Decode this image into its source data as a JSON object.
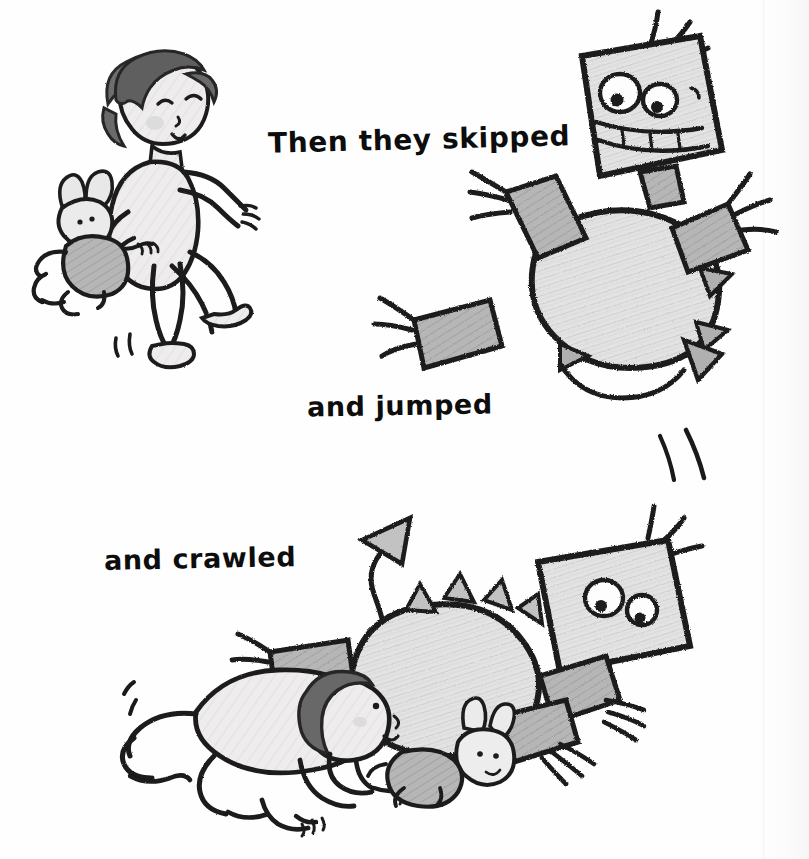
{
  "page": {
    "type": "childrens-book-illustration-page",
    "background_color": "#ffffff",
    "medium": "pencil and ink sketch",
    "width": 809,
    "height": 859
  },
  "captions": [
    {
      "id": "skipped",
      "text": "Then they skipped",
      "x": 268,
      "y": 126,
      "font_size": 28
    },
    {
      "id": "jumped",
      "text": "and jumped",
      "x": 307,
      "y": 392,
      "font_size": 27
    },
    {
      "id": "crawled",
      "text": "and crawled",
      "x": 104,
      "y": 545,
      "font_size": 27
    }
  ],
  "scenes": [
    {
      "id": "skipping",
      "caption": "Then they skipped",
      "figures": [
        {
          "name": "child-skipping",
          "description": "young child with dark bobbed hair, eyes closed, rosy cheeks, skipping with one leg raised",
          "holds": "stuffed-bunny",
          "position": "top-left"
        },
        {
          "name": "stuffed-bunny",
          "description": "grey plush bunny with long ears and dot eyes tucked under the child's arm",
          "position": "top-left-lower"
        },
        {
          "name": "robot-creature-skipping",
          "description": "pencil-drawn robot dinosaur with square head, two big round eyes, wide toothy grin, antennae, rectangular clawed limbs, spiked back and arrow tail",
          "position": "top-right"
        }
      ],
      "motion_marks": 2
    },
    {
      "id": "jumping",
      "caption": "and jumped",
      "figures": [
        {
          "name": "robot-creature-jumping",
          "description": "same robot creature mid-jump with arrow-tipped tail curving below",
          "position": "right-middle"
        }
      ],
      "motion_marks": 2
    },
    {
      "id": "crawling",
      "caption": "and crawled",
      "figures": [
        {
          "name": "child-crawling",
          "description": "child crawling on hands and knees, dark bob hair, looking forward",
          "position": "bottom-left"
        },
        {
          "name": "stuffed-bunny-crawling",
          "description": "grey plush bunny lying beside the crawling child",
          "position": "bottom-center"
        },
        {
          "name": "robot-creature-crawling",
          "description": "robot creature crawling low with tilted square head, round eyes, antennae, spiked back and tall arrow tail",
          "position": "bottom-right"
        }
      ],
      "motion_marks": 2
    }
  ],
  "palette": {
    "ink": "#1a1a1a",
    "paper": "#ffffff",
    "skin_shade": "#eceaea",
    "hair_dark": "#585858",
    "creature_body": "#dcdcdc",
    "creature_limb": "#b0b0b0",
    "bunny_body": "#bdbdbd",
    "cheek": "#d8d8d8"
  }
}
